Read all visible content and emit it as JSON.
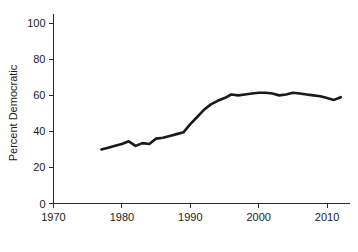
{
  "chart_data": {
    "type": "line",
    "title": "",
    "subtitle": "",
    "xlabel": "",
    "ylabel": "Percent Democratic",
    "xlim": [
      1970,
      2013
    ],
    "ylim": [
      0,
      105
    ],
    "xticks": [
      1970,
      1980,
      1990,
      2000,
      2010
    ],
    "yticks": [
      0,
      20,
      40,
      60,
      80,
      100
    ],
    "xtick_labels": [
      "1970",
      "1980",
      "1990",
      "2000",
      "2010"
    ],
    "ytick_labels": [
      "0",
      "20",
      "40",
      "60",
      "80",
      "100"
    ],
    "grid": false,
    "legend": "none",
    "annotations": [],
    "line_color": "#1a1a1a",
    "axis_color": "#2b2b2b",
    "background_color": "#ffffff",
    "series": [
      {
        "name": "Percent Democratic",
        "color": "#1a1a1a",
        "x": [
          1977,
          1978,
          1979,
          1980,
          1981,
          1982,
          1983,
          1984,
          1985,
          1986,
          1987,
          1988,
          1989,
          1990,
          1991,
          1992,
          1993,
          1994,
          1995,
          1996,
          1997,
          1998,
          1999,
          2000,
          2001,
          2002,
          2003,
          2004,
          2005,
          2006,
          2007,
          2008,
          2009,
          2010,
          2011,
          2012
        ],
        "values": [
          30,
          31,
          32,
          33,
          34.5,
          32,
          33.5,
          33,
          36,
          36.5,
          37.5,
          38.5,
          39.5,
          44,
          48,
          52,
          55,
          57,
          58.5,
          60.5,
          60,
          60.5,
          61,
          61.5,
          61.5,
          61,
          60,
          60.5,
          61.5,
          61,
          60.5,
          60,
          59.5,
          58.5,
          57.5,
          59
        ]
      }
    ]
  }
}
